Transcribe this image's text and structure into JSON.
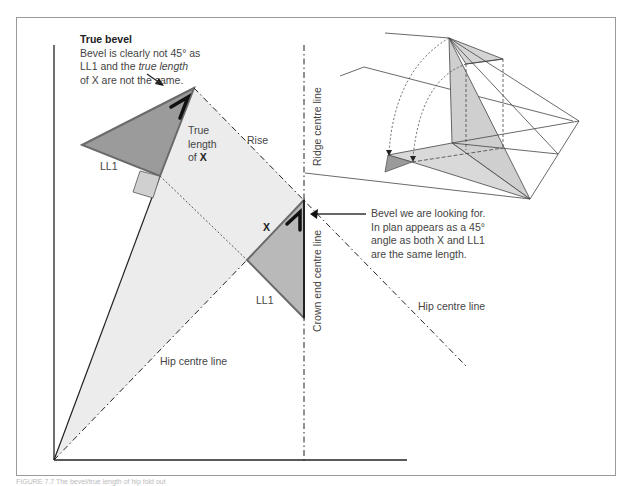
{
  "figure": {
    "caption": "FIGURE 7.7 The bevel/true length of hip fold out"
  },
  "labels": {
    "true_bevel_title": "True bevel",
    "true_bevel_line1": "Bevel is clearly not 45° as",
    "true_bevel_line2_a": "LL1 and the ",
    "true_bevel_line2_em": "true length",
    "true_bevel_line3": "of X are not the same.",
    "true_length_line1": "True",
    "true_length_line2": "length",
    "true_length_line3_a": "of ",
    "true_length_line3_b": "X",
    "rise": "Rise",
    "ll1_upper": "LL1",
    "ll1_lower": "LL1",
    "x_lower": "X",
    "ridge_centre_line": "Ridge centre line",
    "crown_end_centre_line": "Crown end centre line",
    "hip_centre_line_right": "Hip centre line",
    "hip_centre_line_left": "Hip centre line",
    "bevel_note_line1": "Bevel we are looking for.",
    "bevel_note_line2": "In plan appears as a 45°",
    "bevel_note_line3": "angle as both X and LL1",
    "bevel_note_line4": "are the same length."
  },
  "colors": {
    "dark_fill": "#9b9b9b",
    "light_fill": "#ececec",
    "mid_fill": "#c8c8c8",
    "line": "#1a1a1a",
    "outline": "#707070"
  }
}
